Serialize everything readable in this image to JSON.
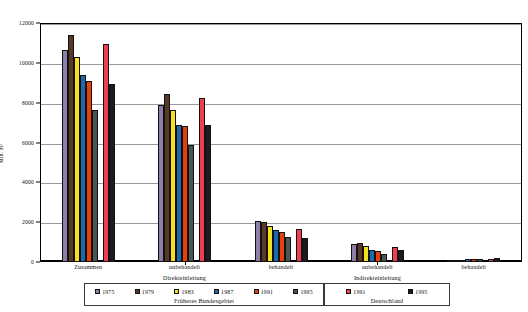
{
  "chart_data": {
    "type": "bar",
    "title": "",
    "xlabel": "",
    "ylabel": "Mill. m³",
    "ylim": [
      0,
      12000
    ],
    "yticks": [
      0,
      2000,
      4000,
      6000,
      8000,
      10000,
      12000
    ],
    "ytick_labels": [
      "0",
      "2000",
      "4000",
      "6000",
      "8000",
      "10000",
      "12000"
    ],
    "grid": true,
    "legend_position": "bottom",
    "categories": [
      "Zusammen",
      "unbehandelt",
      "behandelt",
      "unbehandelt",
      "behandelt"
    ],
    "group_labels": [
      "Direkteinleitung",
      "Indirekteinleitung"
    ],
    "series": [
      {
        "name": "1975",
        "region": "Früheres Bundesgebiet",
        "color": "#8b7fa8",
        "values": [
          10630,
          7880,
          2060,
          880,
          60
        ]
      },
      {
        "name": "1979",
        "region": "Früheres Bundesgebiet",
        "color": "#5a3828",
        "values": [
          11380,
          8430,
          2030,
          960,
          80
        ]
      },
      {
        "name": "1983",
        "region": "Früheres Bundesgebiet",
        "color": "#f5e020",
        "values": [
          10290,
          7650,
          1810,
          790,
          110
        ]
      },
      {
        "name": "1987",
        "region": "Früheres Bundesgebiet",
        "color": "#1f68b0",
        "values": [
          9400,
          6880,
          1600,
          610,
          140
        ]
      },
      {
        "name": "1991",
        "region": "Früheres Bundesgebiet",
        "color": "#e8400a",
        "values": [
          9080,
          6810,
          1520,
          540,
          150
        ]
      },
      {
        "name": "1995",
        "region": "Früheres Bundesgebiet",
        "color": "#4a5652",
        "values": [
          7640,
          5860,
          1280,
          380,
          160
        ]
      },
      {
        "name": "1991",
        "region": "Deutschland",
        "color": "#ef3e52",
        "values": [
          10950,
          8240,
          1680,
          740,
          170
        ]
      },
      {
        "name": "1995",
        "region": "Deutschland",
        "color": "#1c1a22",
        "values": [
          8950,
          6900,
          1200,
          590,
          180
        ]
      }
    ]
  },
  "legend": {
    "boxes": [
      {
        "title": "Früheres Bundesgebiet",
        "entries": [
          {
            "label": "1975",
            "color": "#8b7fa8"
          },
          {
            "label": "1979",
            "color": "#5a3828"
          },
          {
            "label": "1983",
            "color": "#f5e020"
          },
          {
            "label": "1987",
            "color": "#1f68b0"
          },
          {
            "label": "1991",
            "color": "#e8400a"
          },
          {
            "label": "1995",
            "color": "#4a5652"
          }
        ]
      },
      {
        "title": "Deutschland",
        "entries": [
          {
            "label": "1991",
            "color": "#ef3e52"
          },
          {
            "label": "1995",
            "color": "#1c1a22"
          }
        ]
      }
    ]
  }
}
